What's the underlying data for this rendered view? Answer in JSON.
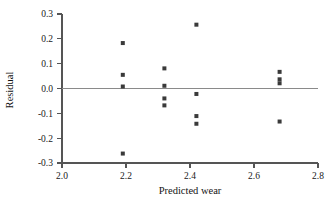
{
  "chart_data": {
    "type": "scatter",
    "title": "",
    "subtitle": "",
    "xlabel": "Predicted wear",
    "ylabel": "Residual",
    "xlim": [
      2.0,
      2.8
    ],
    "ylim": [
      -0.3,
      0.3
    ],
    "xticks": [
      2.0,
      2.2,
      2.4,
      2.6,
      2.8
    ],
    "xticklabels": [
      "2.0",
      "2.2",
      "2.4",
      "2.6",
      "2.8"
    ],
    "yticks": [
      -0.3,
      -0.2,
      -0.1,
      0.0,
      0.1,
      0.2,
      0.3
    ],
    "yticklabels": [
      "-0.3",
      "-0.2",
      "-0.1",
      "0.0",
      "0.1",
      "0.2",
      "0.3"
    ],
    "grid": false,
    "legend": null,
    "legend_position": "none",
    "marker": "square",
    "marker_color": "#3a3a3a",
    "marker_size": 4,
    "reference_line": {
      "orientation": "horizontal",
      "y": 0.0,
      "color": "#8a8a8a"
    },
    "x": [
      2.19,
      2.19,
      2.19,
      2.19,
      2.32,
      2.32,
      2.32,
      2.32,
      2.42,
      2.42,
      2.42,
      2.42,
      2.68,
      2.68,
      2.68,
      2.68
    ],
    "y": [
      0.183,
      0.055,
      0.008,
      -0.262,
      0.081,
      0.011,
      -0.04,
      -0.068,
      0.257,
      -0.022,
      -0.111,
      -0.142,
      0.067,
      0.037,
      0.021,
      -0.133
    ],
    "points": [
      {
        "x": 2.19,
        "y": 0.183
      },
      {
        "x": 2.19,
        "y": 0.055
      },
      {
        "x": 2.19,
        "y": 0.008
      },
      {
        "x": 2.19,
        "y": -0.262
      },
      {
        "x": 2.32,
        "y": 0.081
      },
      {
        "x": 2.32,
        "y": 0.011
      },
      {
        "x": 2.32,
        "y": -0.04
      },
      {
        "x": 2.32,
        "y": -0.068
      },
      {
        "x": 2.42,
        "y": 0.257
      },
      {
        "x": 2.42,
        "y": -0.022
      },
      {
        "x": 2.42,
        "y": -0.111
      },
      {
        "x": 2.42,
        "y": -0.142
      },
      {
        "x": 2.68,
        "y": 0.067
      },
      {
        "x": 2.68,
        "y": 0.037
      },
      {
        "x": 2.68,
        "y": 0.021
      },
      {
        "x": 2.68,
        "y": -0.133
      }
    ]
  }
}
